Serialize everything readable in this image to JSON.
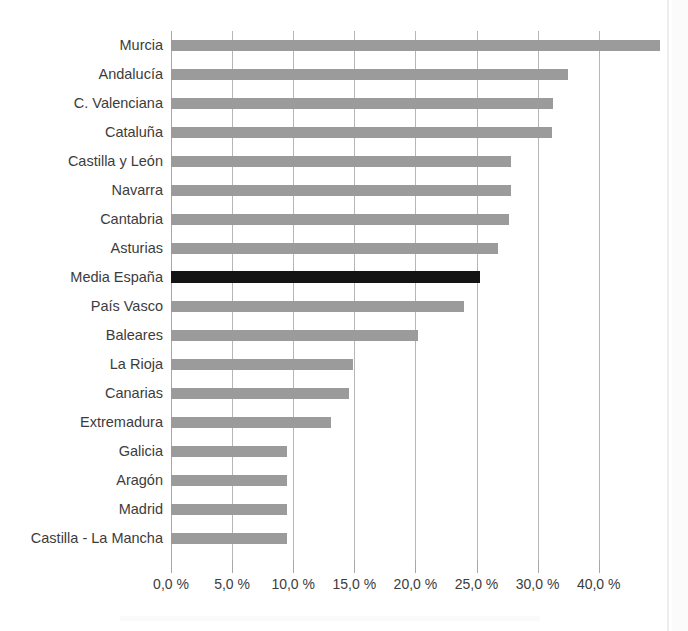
{
  "figure": {
    "title_remnant": "",
    "background": "#ffffff",
    "bar_color": "#9b9b9b",
    "highlight_color": "#141414",
    "grid_color": "#b6b6b6"
  },
  "chart_data": {
    "type": "bar",
    "orientation": "horizontal",
    "title": "",
    "xlabel": "",
    "ylabel": "",
    "grid": true,
    "legend": false,
    "xlim": [
      0,
      40
    ],
    "unit": "%",
    "decimal_separator": ",",
    "tick_labels": [
      "0,0 %",
      "5,0 %",
      "10,0 %",
      "15,0 %",
      "20,0 %",
      "25,0 %",
      "30,0 %",
      "40,0 %"
    ],
    "tick_values": [
      0,
      5,
      10,
      15,
      20,
      25,
      30,
      35
    ],
    "highlight_category": "Media España",
    "categories": [
      "Murcia",
      "Andalucía",
      "C. Valenciana",
      "Cataluña",
      "Castilla y León",
      "Navarra",
      "Cantabria",
      "Asturias",
      "Media España",
      "País Vasco",
      "Baleares",
      "La Rioja",
      "Canarias",
      "Extremadura",
      "Galicia",
      "Aragón",
      "Madrid",
      "Castilla - La Mancha"
    ],
    "values": [
      40.0,
      32.5,
      31.3,
      31.2,
      27.8,
      27.8,
      27.7,
      26.8,
      25.3,
      24.0,
      20.2,
      14.9,
      14.6,
      13.1,
      9.5,
      9.5,
      9.5,
      9.5
    ]
  }
}
